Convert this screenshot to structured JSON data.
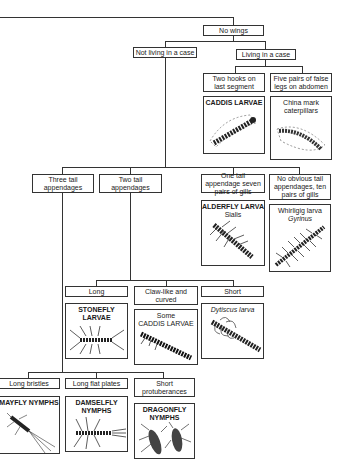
{
  "key": {
    "root": "No wings",
    "level1": [
      {
        "id": "not-case",
        "label": "Not living in a case"
      },
      {
        "id": "case",
        "label": "Living in a case"
      }
    ],
    "case_branch": [
      {
        "label": "Two hooks on last segment",
        "result": {
          "name": "CADDIS LARVAE",
          "icon": "caddis-larva-in-case-illustration"
        }
      },
      {
        "label": "Five pairs of false legs on abdomen",
        "result": {
          "name": "China mark caterpillars",
          "icon": "china-mark-caterpillar-illustration"
        }
      }
    ],
    "tail_branch": [
      {
        "label": "Three tail appendages"
      },
      {
        "label": "Two tail appendages"
      },
      {
        "label": "One tail appendage seven pairs of gills",
        "result": {
          "name": "ALDERFLY LARVA",
          "latin": "Sialis",
          "icon": "alderfly-larva-illustration"
        }
      },
      {
        "label": "No obvious tail appendages, ten pairs of gills",
        "result": {
          "name": "Whirligig larva",
          "latin": "Gyrinus",
          "icon": "whirligig-larva-illustration"
        }
      }
    ],
    "two_tail_branch": [
      {
        "label": "Long",
        "result": {
          "name": "STONEFLY LARVAE",
          "icon": "stonefly-larva-illustration"
        }
      },
      {
        "label": "Claw-like and curved",
        "result": {
          "pre": "Some",
          "name": "CADDIS LARVAE",
          "icon": "free-living-caddis-larva-illustration"
        }
      },
      {
        "label": "Short",
        "result": {
          "name": "Dytiscus larva",
          "icon": "dytiscus-larva-illustration"
        }
      }
    ],
    "three_tail_branch": [
      {
        "label": "Long bristles",
        "result": {
          "name": "MAYFLY NYMPHS",
          "icon": "mayfly-nymph-illustration"
        }
      },
      {
        "label": "Long flat plates",
        "result": {
          "name": "DAMSELFLY NYMPHS",
          "icon": "damselfly-nymph-illustration"
        }
      },
      {
        "label": "Short protuberances",
        "result": {
          "name": "DRAGONFLY NYMPHS",
          "icon": "dragonfly-nymph-illustration"
        }
      }
    ]
  }
}
